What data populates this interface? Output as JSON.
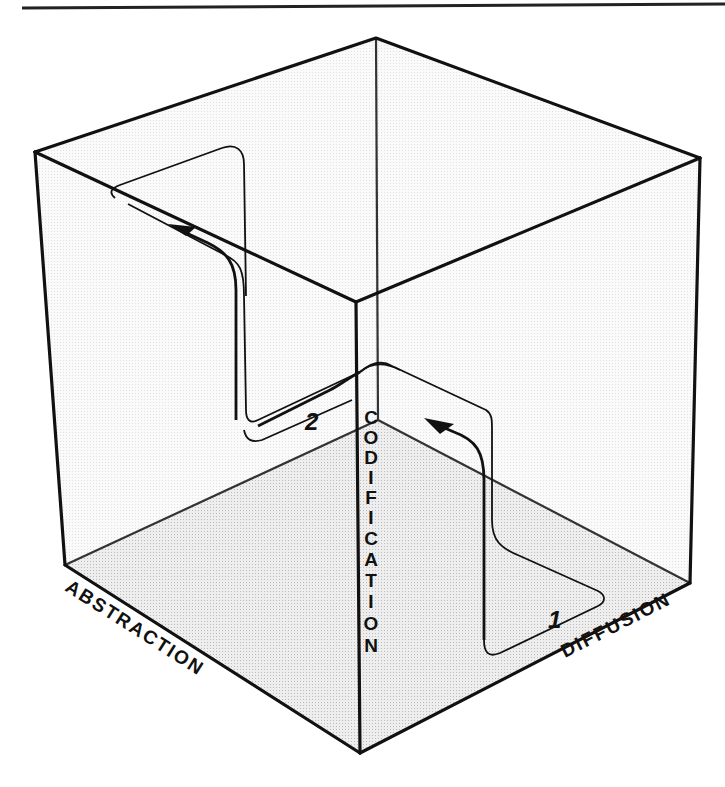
{
  "figure": {
    "title": "",
    "type": "3D cube diagram",
    "axes": {
      "x_label": "ABSTRACTION",
      "y_label": "DIFFUSION",
      "z_label": "CODIFICATION"
    },
    "paths": [
      {
        "label": "1",
        "description": "Cycle in lower right region moving upward toward center"
      },
      {
        "label": "2",
        "description": "Cycle moving from center toward upper left"
      }
    ],
    "colors": {
      "line": "#111111",
      "floor_shade": "#e4e4e4",
      "face_shade": "#f6f6f6",
      "background": "#ffffff"
    }
  }
}
